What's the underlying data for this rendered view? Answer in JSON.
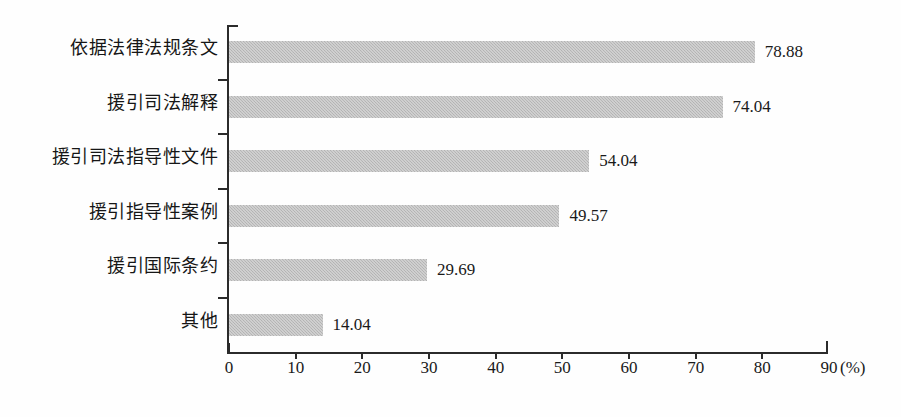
{
  "chart_data": {
    "type": "bar",
    "orientation": "horizontal",
    "title": "",
    "xlabel": "(%)",
    "ylabel": "",
    "xlim": [
      0,
      90
    ],
    "xticks": [
      0,
      10,
      20,
      30,
      40,
      50,
      60,
      70,
      80,
      90
    ],
    "grid": false,
    "legend": null,
    "categories": [
      "依据法律法规条文",
      "援引司法解释",
      "援引司法指导性文件",
      "援引指导性案例",
      "援引国际条约",
      "其他"
    ],
    "values": [
      78.88,
      74.04,
      54.04,
      49.57,
      29.69,
      14.04
    ],
    "value_labels": [
      "78.88",
      "74.04",
      "54.04",
      "49.57",
      "29.69",
      "14.04"
    ],
    "bar_color": "#b9b9b9",
    "axis_color": "#2b2b2b",
    "text_color": "#1a1a1a"
  },
  "axis": {
    "unit_label": "(%)",
    "tick_labels": [
      "0",
      "10",
      "20",
      "30",
      "40",
      "50",
      "60",
      "70",
      "80",
      "90"
    ]
  }
}
